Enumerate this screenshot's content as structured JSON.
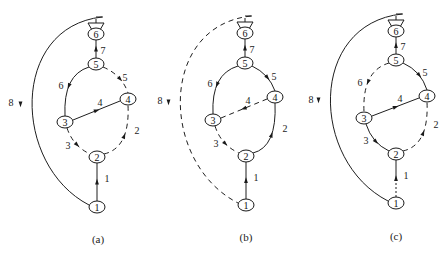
{
  "figure": {
    "panels": [
      {
        "id": "a",
        "caption": "(a)",
        "caption_pos": [
          98,
          239
        ],
        "nodes": [
          {
            "id": "1",
            "label": "1",
            "x": 97,
            "y": 207
          },
          {
            "id": "2",
            "label": "2",
            "x": 97,
            "y": 157
          },
          {
            "id": "3",
            "label": "3",
            "x": 65,
            "y": 122
          },
          {
            "id": "4",
            "label": "4",
            "x": 128,
            "y": 99
          },
          {
            "id": "5",
            "label": "5",
            "x": 96,
            "y": 64
          },
          {
            "id": "6",
            "label": "6",
            "x": 96,
            "y": 34
          }
        ],
        "funnel": {
          "x": 96,
          "top": 17
        },
        "edges": [
          {
            "label": "1",
            "from": "1",
            "to": "2",
            "style": "solid",
            "label_pos": [
              107,
              178
            ]
          },
          {
            "label": "2",
            "from": "2",
            "to": "4",
            "style": "dashed",
            "label_pos": [
              137,
              130
            ]
          },
          {
            "label": "3",
            "from": "3",
            "to": "2",
            "style": "dashed",
            "label_pos": [
              68,
              145
            ]
          },
          {
            "label": "4",
            "from": "3",
            "to": "4",
            "style": "solid",
            "label_pos": [
              100,
              102
            ]
          },
          {
            "label": "5",
            "from": "5",
            "to": "4",
            "style": "dashed",
            "label_pos": [
              125,
              77
            ]
          },
          {
            "label": "6",
            "from": "5",
            "to": "3",
            "style": "solid",
            "label_pos": [
              61,
              85
            ]
          },
          {
            "label": "7",
            "from": "6",
            "to": "5",
            "style": "solid",
            "label_pos": [
              103,
              50
            ]
          },
          {
            "label": "8",
            "from": "6",
            "to": "1",
            "style": "solid",
            "label_pos": [
              11,
              102
            ]
          }
        ],
        "arc_left_x": 20
      },
      {
        "id": "b",
        "caption": "(b)",
        "caption_pos": [
          246,
          237
        ],
        "nodes": [
          {
            "id": "1",
            "label": "1",
            "x": 246,
            "y": 205
          },
          {
            "id": "2",
            "label": "2",
            "x": 246,
            "y": 156
          },
          {
            "id": "3",
            "label": "3",
            "x": 213,
            "y": 120
          },
          {
            "id": "4",
            "label": "4",
            "x": 275,
            "y": 97
          },
          {
            "id": "5",
            "label": "5",
            "x": 245,
            "y": 63
          },
          {
            "id": "6",
            "label": "6",
            "x": 245,
            "y": 33
          }
        ],
        "funnel": {
          "x": 245,
          "top": 16
        },
        "edges": [
          {
            "label": "1",
            "from": "1",
            "to": "2",
            "style": "solid",
            "label_pos": [
              256,
              177
            ]
          },
          {
            "label": "2",
            "from": "2",
            "to": "4",
            "style": "solid",
            "label_pos": [
              285,
              128
            ]
          },
          {
            "label": "3",
            "from": "3",
            "to": "2",
            "style": "dashed",
            "label_pos": [
              216,
              143
            ]
          },
          {
            "label": "4",
            "from": "4",
            "to": "3",
            "style": "dashed",
            "label_pos": [
              248,
              100
            ]
          },
          {
            "label": "5",
            "from": "5",
            "to": "4",
            "style": "solid",
            "label_pos": [
              274,
              76
            ]
          },
          {
            "label": "6",
            "from": "5",
            "to": "3",
            "style": "solid",
            "label_pos": [
              210,
              83
            ]
          },
          {
            "label": "7",
            "from": "6",
            "to": "5",
            "style": "solid",
            "label_pos": [
              252,
              49
            ]
          },
          {
            "label": "8",
            "from": "6",
            "to": "1",
            "style": "dashed",
            "label_pos": [
              160,
              100
            ]
          }
        ],
        "arc_left_x": 168
      },
      {
        "id": "c",
        "caption": "(c)",
        "caption_pos": [
          396,
          236
        ],
        "nodes": [
          {
            "id": "1",
            "label": "1",
            "x": 396,
            "y": 203
          },
          {
            "id": "2",
            "label": "2",
            "x": 396,
            "y": 154
          },
          {
            "id": "3",
            "label": "3",
            "x": 364,
            "y": 118
          },
          {
            "id": "4",
            "label": "4",
            "x": 427,
            "y": 96
          },
          {
            "id": "5",
            "label": "5",
            "x": 396,
            "y": 60
          },
          {
            "id": "6",
            "label": "6",
            "x": 396,
            "y": 31
          }
        ],
        "funnel": {
          "x": 396,
          "top": 14
        },
        "edges": [
          {
            "label": "1",
            "from": "1",
            "to": "2",
            "style": "dotted-solid",
            "label_pos": [
              406,
              175
            ]
          },
          {
            "label": "2",
            "from": "2",
            "to": "4",
            "style": "dashed",
            "label_pos": [
              436,
              124
            ]
          },
          {
            "label": "3",
            "from": "3",
            "to": "2",
            "style": "solid",
            "label_pos": [
              366,
              140
            ]
          },
          {
            "label": "4",
            "from": "3",
            "to": "4",
            "style": "solid",
            "label_pos": [
              400,
              98
            ]
          },
          {
            "label": "5",
            "from": "5",
            "to": "4",
            "style": "solid",
            "label_pos": [
              425,
              72
            ]
          },
          {
            "label": "6",
            "from": "5",
            "to": "3",
            "style": "dashed",
            "label_pos": [
              360,
              82
            ]
          },
          {
            "label": "7",
            "from": "6",
            "to": "5",
            "style": "solid",
            "label_pos": [
              403,
              46
            ]
          },
          {
            "label": "8",
            "from": "6",
            "to": "1",
            "style": "solid",
            "label_pos": [
              311,
              99
            ]
          }
        ],
        "arc_left_x": 318
      }
    ]
  }
}
